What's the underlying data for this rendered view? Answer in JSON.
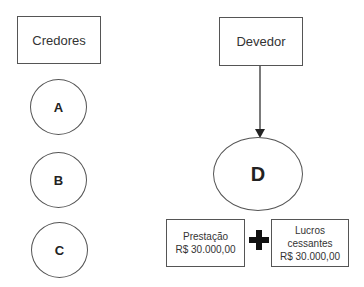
{
  "creditors": {
    "title": "Credores",
    "nodes": [
      "A",
      "B",
      "C"
    ]
  },
  "debtor": {
    "title": "Devedor",
    "node": "D"
  },
  "bottom": {
    "box1": {
      "line1": "Prestação",
      "line2": "R$ 30.000,00"
    },
    "operator": "+",
    "box2": {
      "line1": "Lucros",
      "line2": "cessantes",
      "line3": "R$ 30.000,00"
    }
  }
}
